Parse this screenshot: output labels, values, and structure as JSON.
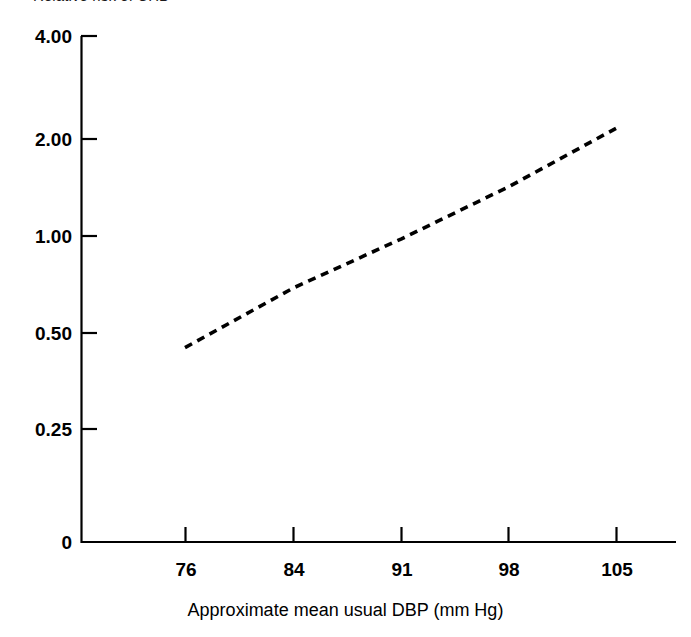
{
  "figure": {
    "title": "Relative risk of CHD",
    "background": "#ffffff",
    "ink_color": "#000000"
  },
  "axes": {
    "x_title": "Approximate mean usual DBP (mm Hg)",
    "y_title": "Relative risk of CHD",
    "x_ticks": [
      "76",
      "84",
      "91",
      "98",
      "105"
    ],
    "y_ticks": [
      "4.00",
      "2.00",
      "1.00",
      "0.50",
      "0.25",
      "0"
    ]
  },
  "chart_data": {
    "type": "line",
    "title": "Relative risk of CHD",
    "xlabel": "Approximate mean usual DBP (mm Hg)",
    "ylabel": "Relative risk of CHD",
    "x": [
      76,
      84,
      91,
      98,
      105
    ],
    "series": [
      {
        "name": "Relative risk of CHD",
        "values": [
          0.45,
          0.69,
          0.98,
          1.42,
          2.15
        ],
        "linestyle": "dashed",
        "color": "#000000",
        "marker": "none"
      }
    ],
    "categories": [
      "76",
      "84",
      "91",
      "98",
      "105"
    ],
    "values": [
      0.45,
      0.69,
      0.98,
      1.42,
      2.15
    ],
    "xlim": [
      72.5,
      110
    ],
    "ylim_labels": [
      "0",
      "0.25",
      "0.50",
      "1.00",
      "2.00",
      "4.00"
    ],
    "yscale": "log-like (0.25, 0.50, 1.00, 2.00, 4.00 evenly spaced)",
    "ytick_values": [
      0,
      0.25,
      0.5,
      1.0,
      2.0,
      4.0
    ],
    "xtick_values": [
      76,
      84,
      91,
      98,
      105
    ],
    "grid": false,
    "legend": "none",
    "annotations": []
  }
}
